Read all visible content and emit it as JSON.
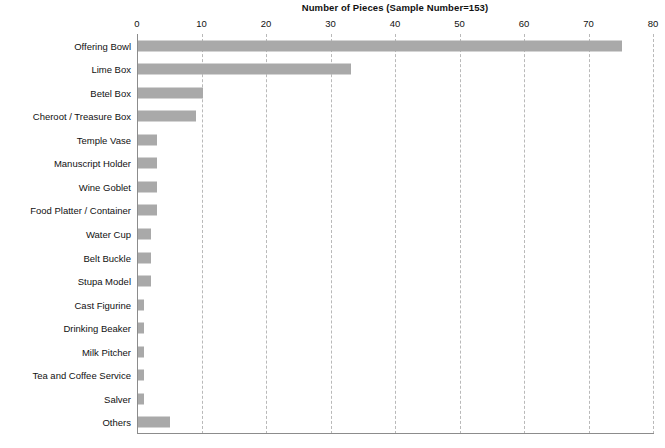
{
  "chart_data": {
    "type": "bar",
    "orientation": "horizontal",
    "title": "Number of Pieces (Sample Number=153)",
    "xlabel": "",
    "ylabel": "",
    "xlim": [
      0,
      80
    ],
    "xticks": [
      0,
      10,
      20,
      30,
      40,
      50,
      60,
      70,
      80
    ],
    "grid": true,
    "legend": "none",
    "bar_color": "#a9a9a9",
    "gridline_color": "#b9b9b9",
    "axis_color": "#8c8c8c",
    "categories": [
      "Offering Bowl",
      "Lime Box",
      "Betel Box",
      "Cheroot / Treasure Box",
      "Temple Vase",
      "Manuscript Holder",
      "Wine Goblet",
      "Food Platter / Container",
      "Water Cup",
      "Belt Buckle",
      "Stupa Model",
      "Cast Figurine",
      "Drinking Beaker",
      "Milk Pitcher",
      "Tea and Coffee Service",
      "Salver",
      "Others"
    ],
    "values": [
      75,
      33,
      10,
      9,
      3,
      3,
      3,
      3,
      2,
      2,
      2,
      1,
      1,
      1,
      1,
      1,
      5
    ]
  }
}
